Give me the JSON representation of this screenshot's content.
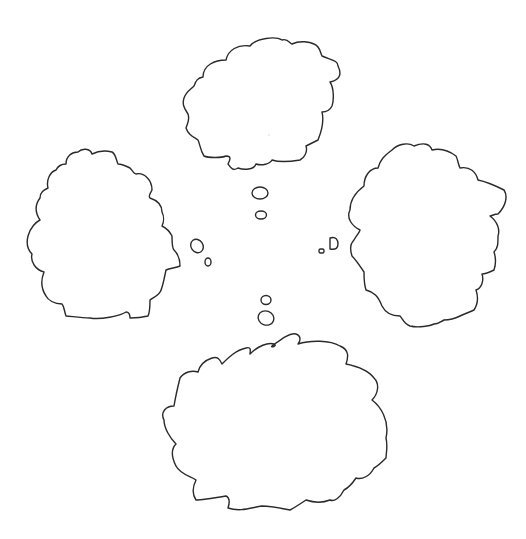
{
  "figure": {
    "background_color": "#ffffff",
    "line_color": "#2a2a2a"
  },
  "bubbles": [
    {
      "id": "top",
      "position": "top",
      "text": "",
      "trail_count": 2
    },
    {
      "id": "left",
      "position": "left",
      "text": "",
      "trail_count": 2
    },
    {
      "id": "right",
      "position": "right",
      "text": "",
      "trail_count": 2
    },
    {
      "id": "bottom",
      "position": "bottom",
      "text": "",
      "trail_count": 2
    }
  ]
}
